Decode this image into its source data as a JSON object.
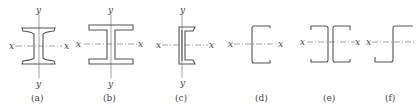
{
  "figure": {
    "panels": [
      {
        "id": "a",
        "caption": "(a)",
        "shape": "rolled I-beam (tapered flanges)",
        "x_axis": "x",
        "y_axis": "y"
      },
      {
        "id": "b",
        "caption": "(b)",
        "shape": "wide-flange H-beam",
        "x_axis": "x",
        "y_axis": "y"
      },
      {
        "id": "c",
        "caption": "(c)",
        "shape": "channel section",
        "x_axis": "x",
        "y_axis": "y"
      },
      {
        "id": "d",
        "caption": "(d)",
        "shape": "cold-formed lipless channel",
        "x_axis": "x"
      },
      {
        "id": "e",
        "caption": "(e)",
        "shape": "back-to-back cold-formed channels",
        "x_axis": "x"
      },
      {
        "id": "f",
        "caption": "(f)",
        "shape": "Z section",
        "x_axis": "x"
      }
    ]
  }
}
